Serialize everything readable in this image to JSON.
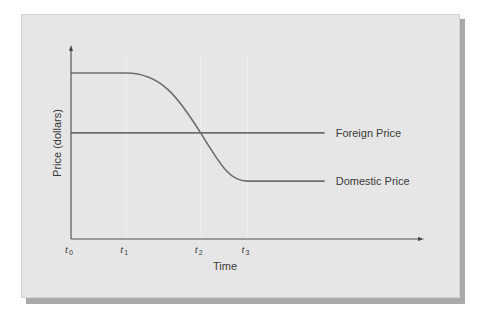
{
  "chart_data": {
    "type": "line",
    "title": "",
    "xlabel": "Time",
    "ylabel": "Price (dollars)",
    "x_ticks": [
      {
        "base": "t",
        "sub": "0",
        "x": 0
      },
      {
        "base": "t",
        "sub": "1",
        "x": 1
      },
      {
        "base": "t",
        "sub": "2",
        "x": 2.35
      },
      {
        "base": "t",
        "sub": "3",
        "x": 3.2
      }
    ],
    "xlim": [
      0,
      6.4
    ],
    "ylim": [
      0,
      10
    ],
    "grid": false,
    "guide_lines_at": [
      1,
      2.35,
      3.2
    ],
    "series": [
      {
        "name": "Foreign Price",
        "label": "Foreign Price",
        "points": [
          [
            0,
            5.5
          ],
          [
            4.6,
            5.5
          ]
        ]
      },
      {
        "name": "Domestic Price",
        "label": "Domestic Price",
        "points": [
          [
            0,
            8.6
          ],
          [
            1,
            8.6
          ],
          [
            2.35,
            5.5
          ],
          [
            3.2,
            3.0
          ],
          [
            4.6,
            3.0
          ]
        ]
      }
    ]
  }
}
